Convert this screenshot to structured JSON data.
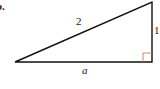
{
  "figure": {
    "part_label": "b.",
    "hypotenuse_label": "2",
    "vertical_side_label": "1",
    "base_label": "a",
    "right_angle_marker_color": "#c87a5a",
    "line_color": "#111111",
    "vertices": {
      "left": [
        15,
        62
      ],
      "right": [
        152,
        62
      ],
      "top": [
        152,
        2
      ]
    }
  }
}
